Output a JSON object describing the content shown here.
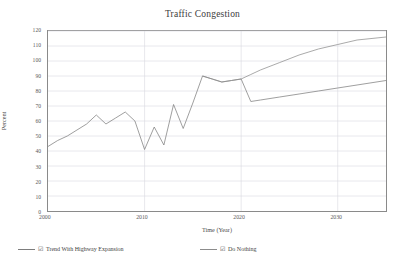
{
  "chart_data": {
    "type": "line",
    "title": "Traffic Congestion",
    "xlabel": "Time (Year)",
    "ylabel": "Percent",
    "xlim": [
      2000,
      2035
    ],
    "ylim": [
      0,
      120
    ],
    "xticks": [
      2000,
      2010,
      2020,
      2030
    ],
    "yticks": [
      0,
      10,
      20,
      30,
      40,
      50,
      60,
      70,
      80,
      90,
      100,
      110,
      120
    ],
    "grid": true,
    "legend_position": "below",
    "series": [
      {
        "name": "Trend With Highway Expansion",
        "color": "#7d7d7d",
        "x": [
          2000,
          2001,
          2002,
          2003,
          2004,
          2005,
          2006,
          2007,
          2008,
          2009,
          2010,
          2011,
          2012,
          2013,
          2014,
          2015,
          2016,
          2017,
          2018,
          2019,
          2020,
          2021,
          2022,
          2024,
          2026,
          2028,
          2030,
          2032,
          2035
        ],
        "values": [
          43,
          47,
          50,
          54,
          58,
          64,
          58,
          62,
          66,
          60,
          41,
          56,
          44,
          71,
          55,
          72,
          90,
          88,
          86,
          87,
          88,
          73,
          74,
          76,
          78,
          80,
          82,
          84,
          87
        ]
      },
      {
        "name": "Do Nothing",
        "color": "#8c8c8c",
        "x": [
          2016,
          2017,
          2018,
          2019,
          2020,
          2021,
          2022,
          2024,
          2026,
          2028,
          2030,
          2032,
          2035
        ],
        "values": [
          90,
          88,
          86,
          87,
          88,
          91,
          94,
          99,
          104,
          108,
          111,
          114,
          116
        ]
      }
    ]
  },
  "legend": {
    "entries": [
      {
        "label": "Trend With Highway Expansion",
        "check": "☑"
      },
      {
        "label": "Do Nothing",
        "check": "☑"
      }
    ]
  }
}
